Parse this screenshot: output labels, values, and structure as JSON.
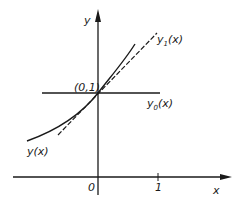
{
  "figure": {
    "axes": {
      "x_label": "x",
      "y_label": "y",
      "origin_label": "0",
      "tick_x1_label": "1"
    },
    "point_label": "(0,1)",
    "curves": {
      "y": "y(x)",
      "y0": "y",
      "y0_sub": "0",
      "y0_arg": "(x)",
      "y1": "y",
      "y1_sub": "1",
      "y1_arg": "(x)"
    },
    "colors": {
      "ink": "#1a1a1a",
      "background": "#ffffff"
    }
  }
}
